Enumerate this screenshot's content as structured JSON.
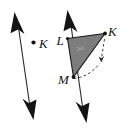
{
  "figure": {
    "background_color": "#ffffff",
    "stroke_color": "#1a1a1a",
    "triangle_fill": "#7d7d7d",
    "dashed_color": "#3a3a3a",
    "labels": {
      "preimage_point": "K",
      "triangle_vertex_top_left": "L",
      "triangle_vertex_top_right": "K",
      "triangle_vertex_bottom": "M"
    },
    "elements": [
      {
        "name": "left-line-of-reflection",
        "type": "double-headed-arrow",
        "x1": 17,
        "y1": 18,
        "x2": 31,
        "y2": 113
      },
      {
        "name": "left-point-K",
        "type": "point",
        "cx": 33,
        "cy": 42,
        "label": "K",
        "label_x": 39,
        "label_y": 47
      },
      {
        "name": "right-line-of-reflection",
        "type": "double-headed-arrow",
        "x1": 70,
        "y1": 16,
        "x2": 85,
        "y2": 116
      },
      {
        "name": "triangle-KLM",
        "type": "polygon",
        "points": "67,38 105,33 73,77",
        "label_L": "L",
        "label_K": "K",
        "label_M": "M"
      },
      {
        "name": "dashed-arrow-K",
        "type": "dashed-arrow",
        "x1": 104,
        "y1": 38,
        "x2": 101,
        "y2": 60
      },
      {
        "name": "dashed-arc-M",
        "type": "dashed-curve",
        "from": "M",
        "to": "near-K-arrow"
      }
    ]
  }
}
